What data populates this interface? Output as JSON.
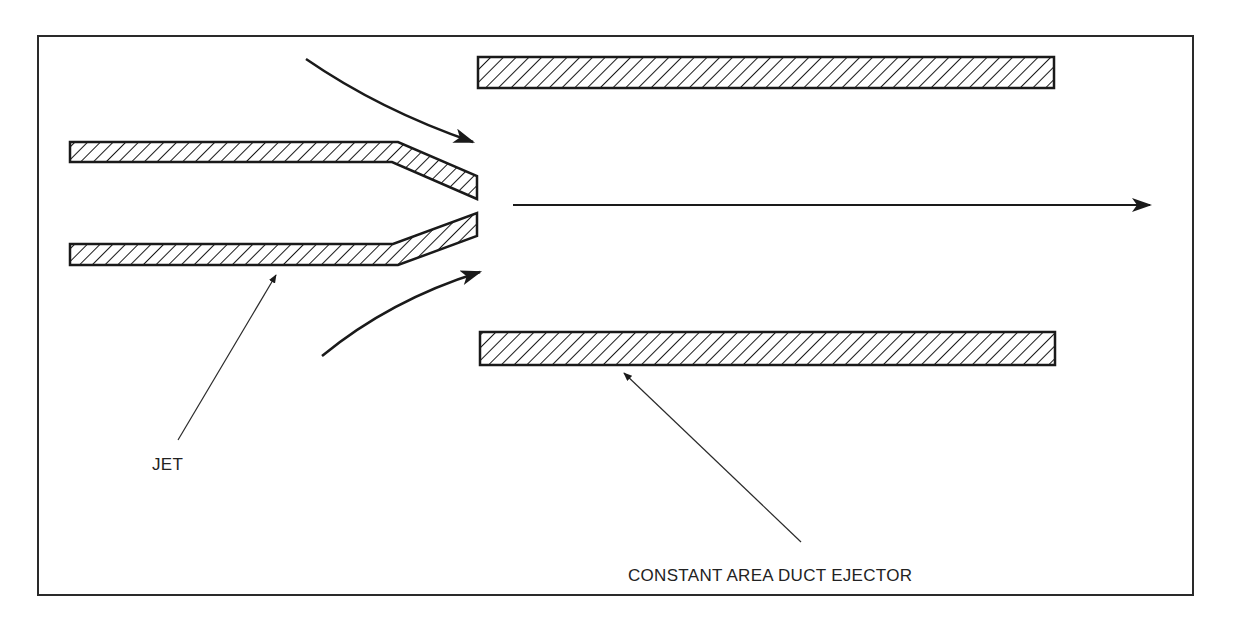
{
  "diagram": {
    "labels": {
      "jet": "JET",
      "ejector": "CONSTANT AREA DUCT EJECTOR"
    },
    "colors": {
      "stroke": "#1a1a1a",
      "background": "#ffffff"
    }
  }
}
